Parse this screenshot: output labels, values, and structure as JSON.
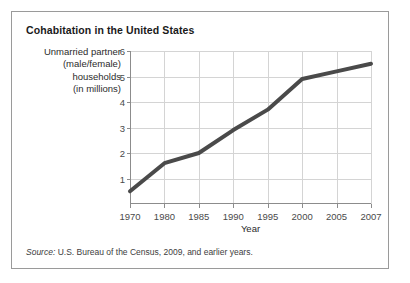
{
  "figure": {
    "title": "Cohabitation in the United States",
    "source_lead": "Source:",
    "source_text": " U.S. Bureau of the Census, 2009, and earlier years."
  },
  "chart_data": {
    "type": "line",
    "title": "Cohabitation in the United States",
    "xlabel": "Year",
    "ylabel": "Unmarried partner (male/female) households (in millions)",
    "ylabel_lines": [
      "Unmarried partner",
      "(male/female)",
      "households",
      "(in millions)"
    ],
    "categories": [
      "1970",
      "1980",
      "1985",
      "1990",
      "1995",
      "2000",
      "2005",
      "2007"
    ],
    "values": [
      0.5,
      1.6,
      2.0,
      2.9,
      3.7,
      4.9,
      5.2,
      5.5
    ],
    "series": [
      {
        "name": "Unmarried partner households",
        "values": [
          0.5,
          1.6,
          2.0,
          2.9,
          3.7,
          4.9,
          5.2,
          5.5
        ]
      }
    ],
    "ylim": [
      0,
      6
    ],
    "yticks": [
      1,
      2,
      3,
      4,
      5,
      6
    ],
    "ytick_labels": [
      "1",
      "2",
      "3",
      "4",
      "5",
      "6"
    ],
    "xtick_labels": [
      "1970",
      "1980",
      "1985",
      "1990",
      "1995",
      "2000",
      "2005",
      "2007"
    ],
    "grid": true,
    "legend": false,
    "line_color": "#4a4a4a",
    "grid_color": "#d4d4d4",
    "axis_color": "#8c8c8c"
  }
}
